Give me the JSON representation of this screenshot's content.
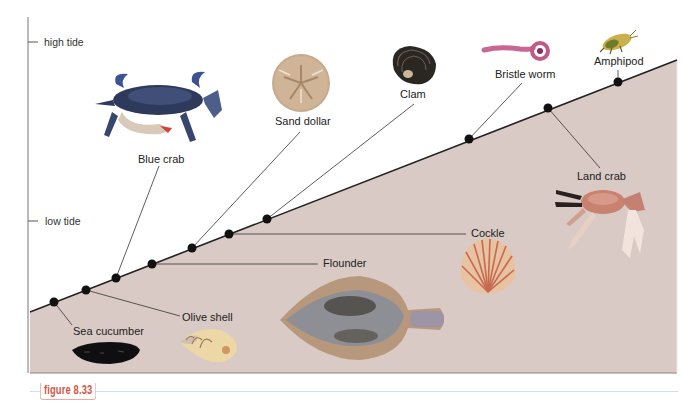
{
  "figure": {
    "label": "figure 8.33",
    "accent_color": "#d2573f",
    "shore_color": "#d9cac6",
    "line_color": "#222222"
  },
  "axis": {
    "high_tide": "high tide",
    "low_tide": "low tide"
  },
  "organisms": [
    {
      "id": "sea-cucumber",
      "label": "Sea cucumber",
      "zone": "subtidal"
    },
    {
      "id": "olive-shell",
      "label": "Olive shell",
      "zone": "subtidal"
    },
    {
      "id": "blue-crab",
      "label": "Blue crab",
      "zone": "subtidal"
    },
    {
      "id": "flounder",
      "label": "Flounder",
      "zone": "subtidal"
    },
    {
      "id": "sand-dollar",
      "label": "Sand dollar",
      "zone": "low intertidal"
    },
    {
      "id": "cockle",
      "label": "Cockle",
      "zone": "low intertidal"
    },
    {
      "id": "clam",
      "label": "Clam",
      "zone": "mid intertidal"
    },
    {
      "id": "bristle-worm",
      "label": "Bristle worm",
      "zone": "high intertidal"
    },
    {
      "id": "land-crab",
      "label": "Land crab",
      "zone": "high intertidal"
    },
    {
      "id": "amphipod",
      "label": "Amphipod",
      "zone": "high intertidal"
    }
  ]
}
